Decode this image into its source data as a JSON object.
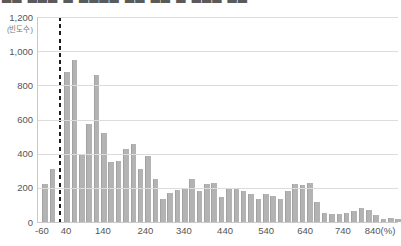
{
  "clipped_title": "██ ███ █ ████ ██ ██ █ ███ ██",
  "colors": {
    "background": "#ffffff",
    "bar": "#b3b3b3",
    "bar_edge": "#a2a2a2",
    "gridline": "#dcdcdc",
    "axis_line": "#c9c9c9",
    "tick_text": "#555555",
    "reference_line": "#1c1c1c"
  },
  "chart_data": {
    "type": "bar",
    "subtype": "histogram",
    "title": "",
    "xlabel": "(%)",
    "ylabel": "(빈도수)",
    "ylim": [
      0,
      1200
    ],
    "grid": true,
    "bin_width_percent_points": 20,
    "y_ticks_display": [
      "0",
      "200",
      "400",
      "600",
      "800",
      "1,000",
      "1,200"
    ],
    "y_tick_values": [
      0,
      200,
      400,
      600,
      800,
      1000,
      1200
    ],
    "x_ticks": [
      {
        "label": "-60",
        "pct": 1.5
      },
      {
        "label": "40",
        "pct": 8.2
      },
      {
        "label": "140",
        "pct": 18.4
      },
      {
        "label": "240",
        "pct": 30.2
      },
      {
        "label": "340",
        "pct": 40.9
      },
      {
        "label": "440",
        "pct": 52.3
      },
      {
        "label": "540",
        "pct": 63.7
      },
      {
        "label": "640",
        "pct": 74.5
      },
      {
        "label": "740",
        "pct": 85.0
      },
      {
        "label": "840(%)",
        "pct": 95.3
      }
    ],
    "values": [
      220,
      310,
      880,
      950,
      390,
      575,
      860,
      520,
      350,
      360,
      430,
      455,
      310,
      385,
      250,
      135,
      170,
      190,
      200,
      250,
      180,
      225,
      230,
      145,
      200,
      195,
      180,
      165,
      135,
      165,
      150,
      135,
      180,
      225,
      215,
      230,
      120,
      55,
      45,
      45,
      55,
      65,
      80,
      70,
      40,
      20,
      25,
      20
    ],
    "dashed_reference_line": {
      "orientation": "vertical",
      "at_value_percent": 0,
      "slot_index": 2
    },
    "legend": null
  }
}
